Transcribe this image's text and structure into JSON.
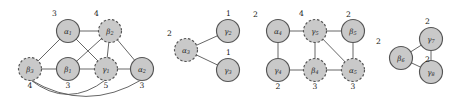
{
  "figure": {
    "type": "graph-collection",
    "node_fill": "#c9c9c9",
    "node_stroke": "#555555",
    "edge_color": "#555555",
    "background": "#ffffff"
  },
  "graphs": [
    {
      "id": "graph-1",
      "nodes": [
        {
          "id": "a1",
          "letter": "α",
          "sub": "1",
          "weight": "3",
          "style": "solid",
          "cx": 68,
          "cy": 31,
          "weight_pos": "top"
        },
        {
          "id": "b2",
          "letter": "β",
          "sub": "2",
          "weight": "4",
          "style": "dashed",
          "cx": 110,
          "cy": 31,
          "weight_pos": "top"
        },
        {
          "id": "b3",
          "letter": "β",
          "sub": "3",
          "weight": "4",
          "style": "dashed",
          "cx": 30,
          "cy": 69,
          "weight_pos": "bottom"
        },
        {
          "id": "b1",
          "letter": "β",
          "sub": "1",
          "weight": "3",
          "style": "solid",
          "cx": 68,
          "cy": 69,
          "weight_pos": "bottom"
        },
        {
          "id": "g1",
          "letter": "γ",
          "sub": "1",
          "weight": "5",
          "style": "dashed",
          "cx": 106,
          "cy": 69,
          "weight_pos": "bottom"
        },
        {
          "id": "a2",
          "letter": "α",
          "sub": "2",
          "weight": "3",
          "style": "solid",
          "cx": 142,
          "cy": 69,
          "weight_pos": "bottom"
        }
      ],
      "edges": [
        {
          "from": "a1",
          "to": "b2",
          "kind": "line"
        },
        {
          "from": "a1",
          "to": "b3",
          "kind": "line"
        },
        {
          "from": "a1",
          "to": "g1",
          "kind": "line"
        },
        {
          "from": "b2",
          "to": "b1",
          "kind": "line"
        },
        {
          "from": "b2",
          "to": "g1",
          "kind": "line"
        },
        {
          "from": "b2",
          "to": "a2",
          "kind": "line"
        },
        {
          "from": "b3",
          "to": "b1",
          "kind": "line"
        },
        {
          "from": "b1",
          "to": "g1",
          "kind": "line"
        },
        {
          "from": "g1",
          "to": "a2",
          "kind": "line"
        },
        {
          "from": "b3",
          "to": "g1",
          "kind": "curve"
        },
        {
          "from": "b3",
          "to": "a2",
          "kind": "curve"
        }
      ]
    },
    {
      "id": "graph-2",
      "nodes": [
        {
          "id": "a3",
          "letter": "α",
          "sub": "3",
          "weight": "2",
          "style": "dashed",
          "cx": 186,
          "cy": 50,
          "weight_pos": "top"
        },
        {
          "id": "g2",
          "letter": "γ",
          "sub": "2",
          "weight": "1",
          "style": "solid",
          "cx": 228,
          "cy": 31,
          "weight_pos": "top"
        },
        {
          "id": "g3",
          "letter": "γ",
          "sub": "3",
          "weight": "1",
          "style": "solid",
          "cx": 228,
          "cy": 70,
          "weight_pos": "top"
        }
      ],
      "edges": [
        {
          "from": "a3",
          "to": "g2",
          "kind": "line"
        },
        {
          "from": "a3",
          "to": "g3",
          "kind": "line"
        }
      ]
    },
    {
      "id": "graph-3",
      "nodes": [
        {
          "id": "a4",
          "letter": "α",
          "sub": "4",
          "weight": "2",
          "style": "solid",
          "cx": 278,
          "cy": 31,
          "weight_pos": "top"
        },
        {
          "id": "g5",
          "letter": "γ",
          "sub": "5",
          "weight": "4",
          "style": "dashed",
          "cx": 315,
          "cy": 31,
          "weight_pos": "top"
        },
        {
          "id": "b5",
          "letter": "β",
          "sub": "5",
          "weight": "2",
          "style": "solid",
          "cx": 353,
          "cy": 31,
          "weight_pos": "top"
        },
        {
          "id": "g4",
          "letter": "γ",
          "sub": "4",
          "weight": "2",
          "style": "solid",
          "cx": 278,
          "cy": 70,
          "weight_pos": "bottom"
        },
        {
          "id": "b4",
          "letter": "β",
          "sub": "4",
          "weight": "3",
          "style": "dashed",
          "cx": 315,
          "cy": 70,
          "weight_pos": "bottom"
        },
        {
          "id": "a5",
          "letter": "α",
          "sub": "5",
          "weight": "3",
          "style": "dashed",
          "cx": 353,
          "cy": 70,
          "weight_pos": "bottom"
        }
      ],
      "edges": [
        {
          "from": "a4",
          "to": "g5",
          "kind": "line"
        },
        {
          "from": "g5",
          "to": "b5",
          "kind": "line"
        },
        {
          "from": "a4",
          "to": "g4",
          "kind": "line"
        },
        {
          "from": "g5",
          "to": "b4",
          "kind": "line"
        },
        {
          "from": "b5",
          "to": "a5",
          "kind": "line"
        },
        {
          "from": "g4",
          "to": "b4",
          "kind": "line"
        },
        {
          "from": "b4",
          "to": "a5",
          "kind": "line"
        },
        {
          "from": "g5",
          "to": "a5",
          "kind": "line"
        }
      ]
    },
    {
      "id": "graph-4",
      "nodes": [
        {
          "id": "b6",
          "letter": "β",
          "sub": "6",
          "weight": "2",
          "style": "solid",
          "cx": 401,
          "cy": 58,
          "weight_pos": "top"
        },
        {
          "id": "g7",
          "letter": "γ",
          "sub": "7",
          "weight": "2",
          "style": "solid",
          "cx": 431,
          "cy": 39,
          "weight_pos": "top"
        },
        {
          "id": "g8",
          "letter": "γ",
          "sub": "8",
          "weight": "2",
          "style": "solid",
          "cx": 431,
          "cy": 72,
          "weight_pos": "top"
        }
      ],
      "edges": [
        {
          "from": "b6",
          "to": "g7",
          "kind": "line"
        },
        {
          "from": "b6",
          "to": "g8",
          "kind": "line"
        },
        {
          "from": "g7",
          "to": "g8",
          "kind": "line"
        }
      ]
    }
  ]
}
